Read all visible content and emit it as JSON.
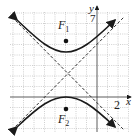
{
  "graph": {
    "x_axis_label": "x",
    "y_axis_label": "y",
    "x_tick_label": "2",
    "y_tick_label": "7",
    "focus_upper_label": "F",
    "focus_upper_sub": "1",
    "focus_lower_label": "F",
    "focus_lower_sub": "2",
    "curve_color": "#1a1a1a",
    "grid_color": "#b0b0b0"
  }
}
